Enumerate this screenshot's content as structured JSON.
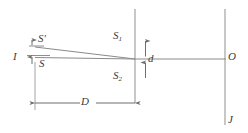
{
  "diagram": {
    "stroke_color": "#9a9a9a",
    "text_color": "#3b3b3b",
    "background": "#ffffff",
    "labels": {
      "source_plane": "I",
      "source_upper": "S'",
      "source_lower": "S",
      "slit_upper_base": "S",
      "slit_upper_sub": "1",
      "slit_lower_base": "S",
      "slit_lower_sub": "2",
      "slit_separation": "d",
      "screen_center": "O",
      "screen_plane": "J",
      "distance": "D"
    }
  }
}
